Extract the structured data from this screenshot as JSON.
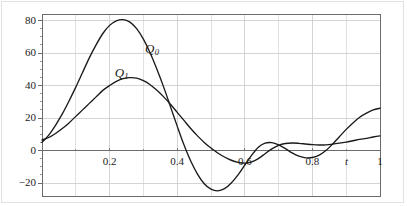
{
  "chart_data": {
    "type": "line",
    "title": "",
    "subtitle": "",
    "xlabel": "t",
    "ylabel": "",
    "xlim": [
      0,
      1
    ],
    "ylim": [
      -28,
      84
    ],
    "grid": true,
    "legend_position": "inline-annotations",
    "x_ticks": [
      {
        "value": 0.2,
        "label": "0.2"
      },
      {
        "value": 0.4,
        "label": "0.4"
      },
      {
        "value": 0.6,
        "label": "0.6"
      },
      {
        "value": 0.8,
        "label": "0.8"
      },
      {
        "value": 1.0,
        "label": "1"
      }
    ],
    "x_minor_ticks": [
      0.1,
      0.3,
      0.5,
      0.7,
      0.9
    ],
    "y_ticks": [
      {
        "value": 80,
        "label": "80"
      },
      {
        "value": 60,
        "label": "60"
      },
      {
        "value": 40,
        "label": "40"
      },
      {
        "value": 20,
        "label": "20"
      },
      {
        "value": 0,
        "label": "0"
      },
      {
        "value": -20,
        "label": "−20"
      }
    ],
    "annotations": [
      {
        "name": "Q0",
        "base": "Q",
        "sub": "0",
        "x": 0.305,
        "y": 62
      },
      {
        "name": "Q1",
        "base": "Q",
        "sub": "1",
        "x": 0.215,
        "y": 47
      }
    ],
    "series": [
      {
        "name": "Q0",
        "label_base": "Q",
        "label_sub": "0",
        "color": "#1a1a1a",
        "x": [
          0.0,
          0.02,
          0.04,
          0.06,
          0.08,
          0.1,
          0.12,
          0.14,
          0.16,
          0.18,
          0.2,
          0.22,
          0.24,
          0.26,
          0.28,
          0.3,
          0.32,
          0.34,
          0.36,
          0.38,
          0.4,
          0.42,
          0.44,
          0.46,
          0.48,
          0.5,
          0.52,
          0.54,
          0.56,
          0.58,
          0.6,
          0.62,
          0.64,
          0.66,
          0.68,
          0.7,
          0.72,
          0.74,
          0.76,
          0.78,
          0.8,
          0.82,
          0.84,
          0.86,
          0.88,
          0.9,
          0.92,
          0.94,
          0.96,
          0.98,
          1.0
        ],
        "y": [
          5.0,
          9.5,
          15.5,
          22.5,
          30.5,
          39.0,
          48.0,
          57.0,
          65.0,
          72.0,
          77.0,
          79.8,
          80.5,
          79.0,
          75.0,
          68.5,
          60.0,
          50.0,
          39.0,
          27.0,
          15.0,
          3.5,
          -6.5,
          -14.5,
          -20.5,
          -23.8,
          -24.8,
          -23.5,
          -20.0,
          -15.0,
          -9.0,
          -3.0,
          2.0,
          4.5,
          4.8,
          3.5,
          1.2,
          -1.5,
          -3.5,
          -4.5,
          -4.3,
          -2.8,
          0.0,
          4.0,
          8.5,
          13.0,
          17.0,
          20.5,
          23.0,
          25.0,
          26.0
        ]
      },
      {
        "name": "Q1",
        "label_base": "Q",
        "label_sub": "1",
        "color": "#1a1a1a",
        "x": [
          0.0,
          0.02,
          0.04,
          0.06,
          0.08,
          0.1,
          0.12,
          0.14,
          0.16,
          0.18,
          0.2,
          0.22,
          0.24,
          0.26,
          0.28,
          0.3,
          0.32,
          0.34,
          0.36,
          0.38,
          0.4,
          0.42,
          0.44,
          0.46,
          0.48,
          0.5,
          0.52,
          0.54,
          0.56,
          0.58,
          0.6,
          0.62,
          0.64,
          0.66,
          0.68,
          0.7,
          0.72,
          0.74,
          0.76,
          0.78,
          0.8,
          0.82,
          0.84,
          0.86,
          0.88,
          0.9,
          0.92,
          0.94,
          0.96,
          0.98,
          1.0
        ],
        "y": [
          6.5,
          8.0,
          10.5,
          13.5,
          17.0,
          21.0,
          25.0,
          29.0,
          33.0,
          37.0,
          40.0,
          42.5,
          44.2,
          44.8,
          44.5,
          43.0,
          40.5,
          37.0,
          33.0,
          28.5,
          23.5,
          18.5,
          13.5,
          9.0,
          5.0,
          1.5,
          -1.5,
          -4.0,
          -6.0,
          -7.3,
          -7.8,
          -7.0,
          -5.0,
          -2.0,
          1.0,
          3.2,
          4.3,
          4.6,
          4.4,
          4.0,
          3.6,
          3.4,
          3.5,
          3.9,
          4.5,
          5.2,
          6.0,
          6.8,
          7.5,
          8.3,
          9.0
        ]
      }
    ]
  },
  "plot_geometry": {
    "left": 42,
    "right": 380,
    "top": 14,
    "bottom": 196,
    "zero_y": 143
  },
  "colors": {
    "axis": "#6b6b6b",
    "grid": "#c9c9c9",
    "curve": "#1a1a1a",
    "text": "#1a1a1a",
    "border": "#e2e2e2",
    "background": "#ffffff"
  }
}
